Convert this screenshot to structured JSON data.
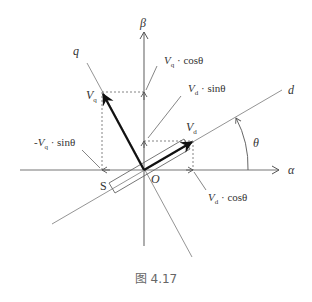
{
  "figure": {
    "caption": "图 4.17",
    "axes": {
      "alpha_label": "α",
      "beta_label": "β",
      "d_label": "d",
      "q_label": "q",
      "origin_label": "O",
      "angle_label": "θ"
    },
    "vectors": {
      "vd_label": "V",
      "vd_sub": "d",
      "vq_label": "V",
      "vq_sub": "q"
    },
    "projections": {
      "vq_cos": {
        "prefix": "V",
        "sub": "q",
        "suffix": " · cosθ"
      },
      "vd_sin": {
        "prefix": "V",
        "sub": "d",
        "suffix": " · sinθ"
      },
      "neg_vq_sin": {
        "prefix": "-V",
        "sub": "q",
        "suffix": " · sinθ"
      },
      "vd_cos": {
        "prefix": "V",
        "sub": "d",
        "suffix": " · cosθ"
      }
    },
    "magnet_label": "S",
    "colors": {
      "axis": "#777777",
      "vector": "#111111",
      "dashed": "#666666",
      "text": "#333333",
      "caption": "#666666"
    }
  }
}
